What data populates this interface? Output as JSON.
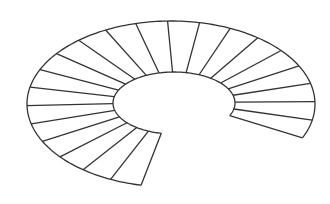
{
  "diagram": {
    "type": "spiral-staircase-plan",
    "stroke_color": "#333333",
    "background": "#ffffff",
    "outer": {
      "cx": 171,
      "cy": 104,
      "rx": 144,
      "ry": 83
    },
    "inner": {
      "cx": 174,
      "cy": 103,
      "rx": 61,
      "ry": 31
    },
    "start_angle_deg": 24,
    "end_angle_deg": -258,
    "step_count": 22
  }
}
